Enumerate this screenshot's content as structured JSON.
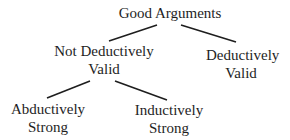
{
  "diagram": {
    "type": "tree",
    "root": {
      "label": "Good Arguments"
    },
    "nodes": {
      "not_deductively_valid": {
        "line1": "Not Deductively",
        "line2": "Valid"
      },
      "deductively_valid": {
        "line1": "Deductively",
        "line2": "Valid"
      },
      "abductively_strong": {
        "line1": "Abductively",
        "line2": "Strong"
      },
      "inductively_strong": {
        "line1": "Inductively",
        "line2": "Strong"
      }
    },
    "edges": [
      {
        "from": "Good Arguments",
        "to": "Not Deductively Valid"
      },
      {
        "from": "Good Arguments",
        "to": "Deductively Valid"
      },
      {
        "from": "Not Deductively Valid",
        "to": "Abductively Strong"
      },
      {
        "from": "Not Deductively Valid",
        "to": "Inductively Strong"
      }
    ],
    "line_color": "#1e1e1e"
  }
}
